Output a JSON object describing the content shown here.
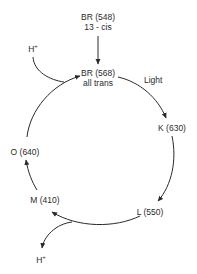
{
  "diagram": {
    "type": "cycle",
    "nodes": [
      {
        "id": "br548",
        "name": "BR (548)",
        "sub": "13 - cis"
      },
      {
        "id": "br568",
        "name": "BR (568)",
        "sub": "all trans"
      },
      {
        "id": "k630",
        "name": "K (630)"
      },
      {
        "id": "l550",
        "name": "L (550)"
      },
      {
        "id": "m410",
        "name": "M (410)"
      },
      {
        "id": "o640",
        "name": "O (640)"
      }
    ],
    "edges": [
      {
        "from": "br548",
        "to": "br568"
      },
      {
        "from": "br568",
        "to": "k630",
        "label": "Light"
      },
      {
        "from": "k630",
        "to": "l550"
      },
      {
        "from": "l550",
        "to": "m410"
      },
      {
        "from": "m410",
        "to": "o640"
      },
      {
        "from": "o640",
        "to": "br568"
      }
    ],
    "proton": {
      "base": "H",
      "sup": "+",
      "uptake_label": "H",
      "release_label": "H"
    },
    "light_label": "Light",
    "stroke_color": "#2a2a2a"
  }
}
